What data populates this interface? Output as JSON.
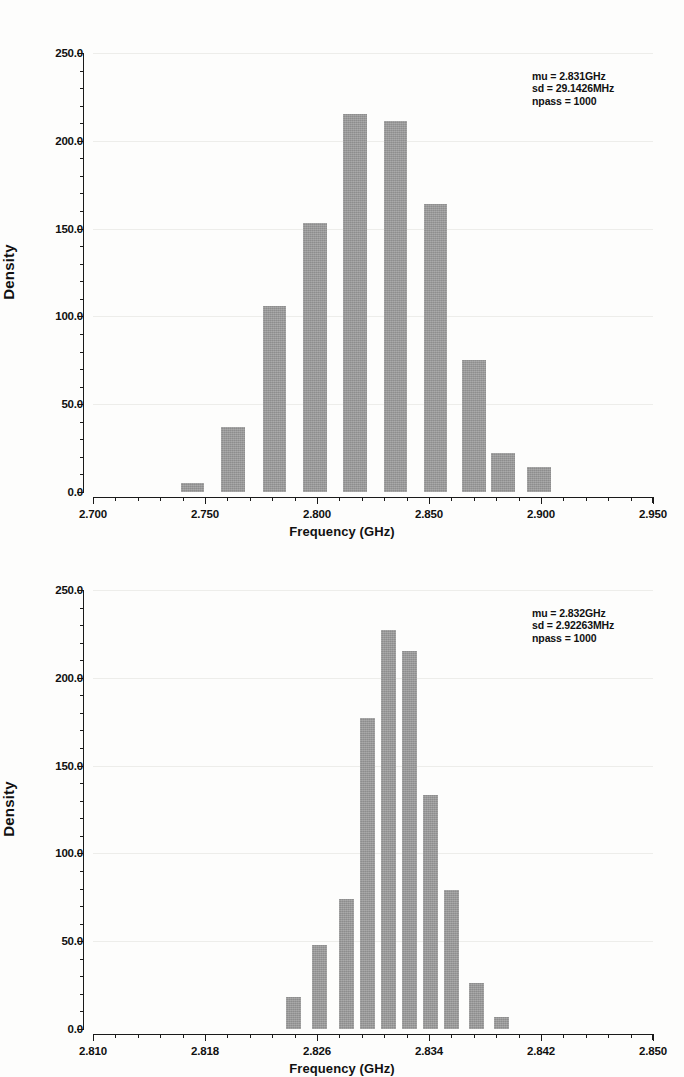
{
  "figure": {
    "background": "#fdfdfc",
    "bar_color": "#989898",
    "axis_color": "#1a1a1a",
    "grid_color": "#ededea"
  },
  "chart_data": [
    {
      "type": "bar",
      "title": "",
      "xlabel": "Frequency (GHz)",
      "ylabel": "Density",
      "xlim": [
        2.7,
        2.95
      ],
      "ylim": [
        0,
        250
      ],
      "grid": true,
      "legend": "none",
      "x_major_ticks": [
        2.7,
        2.75,
        2.8,
        2.85,
        2.9,
        2.95
      ],
      "x_tick_labels": [
        "2.700",
        "2.750",
        "2.800",
        "2.850",
        "2.900",
        "2.950"
      ],
      "x_minor_step": 0.01,
      "y_major_ticks": [
        0,
        50,
        100,
        150,
        200,
        250
      ],
      "y_tick_labels": [
        "0.0",
        "50.0",
        "100.0",
        "150.0",
        "200.0",
        "250.0"
      ],
      "y_minor_step": 10,
      "bar_width": 0.0105,
      "x": [
        2.7445,
        2.7625,
        2.781,
        2.799,
        2.817,
        2.835,
        2.853,
        2.87,
        2.883,
        2.899
      ],
      "values": [
        5,
        37,
        106,
        153,
        215,
        211,
        164,
        75,
        22,
        14
      ],
      "annotation": {
        "mu": "mu = 2.831GHz",
        "sd": "sd = 29.1426MHz",
        "npass": "npass = 1000"
      }
    },
    {
      "type": "bar",
      "title": "",
      "xlabel": "Frequency (GHz)",
      "ylabel": "Density",
      "xlim": [
        2.81,
        2.85
      ],
      "ylim": [
        0,
        250
      ],
      "grid": true,
      "legend": "none",
      "x_major_ticks": [
        2.81,
        2.818,
        2.826,
        2.834,
        2.842,
        2.85
      ],
      "x_tick_labels": [
        "2.810",
        "2.818",
        "2.826",
        "2.834",
        "2.842",
        "2.850"
      ],
      "x_minor_step": 0.0016,
      "y_major_ticks": [
        0,
        50,
        100,
        150,
        200,
        250
      ],
      "y_tick_labels": [
        "0.0",
        "50.0",
        "100.0",
        "150.0",
        "200.0",
        "250.0"
      ],
      "y_minor_step": 10,
      "bar_width": 0.00105,
      "x": [
        2.8243,
        2.8262,
        2.8281,
        2.8296,
        2.8311,
        2.8326,
        2.8341,
        2.8356,
        2.8374,
        2.8392
      ],
      "values": [
        18,
        48,
        74,
        177,
        227,
        215,
        133,
        79,
        26,
        7
      ],
      "annotation": {
        "mu": "mu = 2.832GHz",
        "sd": "sd = 2.92263MHz",
        "npass": "npass = 1000"
      }
    }
  ]
}
